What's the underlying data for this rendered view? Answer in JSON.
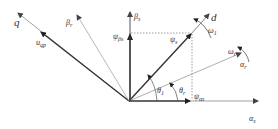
{
  "diagram": {
    "axes": {
      "q": "q",
      "beta_r": {
        "main": "β",
        "sub": "r"
      },
      "beta_s": {
        "main": "β",
        "sub": "s"
      },
      "d": "d",
      "alpha_r": {
        "main": "α",
        "sub": "r"
      },
      "alpha_s": {
        "main": "α",
        "sub": "s"
      }
    },
    "vectors": {
      "u_qp": {
        "main": "u",
        "sub": "qp"
      },
      "psi_s": {
        "main": "ψ",
        "sub": "s"
      },
      "psi_beta_s": {
        "main": "ψ",
        "sub": "βs"
      },
      "psi_alpha_s": {
        "main": "ψ",
        "sub": "αs"
      }
    },
    "angles": {
      "theta_1": {
        "main": "θ",
        "sub": "1"
      },
      "theta_r": {
        "main": "θ",
        "sub": "r"
      }
    },
    "speeds": {
      "omega_1": {
        "main": "ω",
        "sub": "1"
      },
      "omega_r": {
        "main": "ω",
        "sub": "r"
      }
    }
  }
}
